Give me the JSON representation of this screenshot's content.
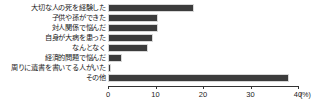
{
  "chart_data": {
    "type": "bar",
    "orientation": "horizontal",
    "title": "",
    "subtitle": "",
    "xlabel": "(%)",
    "ylabel": "",
    "xlim": [
      0,
      40
    ],
    "grid": false,
    "legend": null,
    "axis_unit": "(%)",
    "xticks": [
      0,
      10,
      20,
      30,
      40
    ],
    "xtick_labels": [
      "0",
      "10",
      "20",
      "30",
      "40"
    ],
    "categories": [
      "大切な人の死を経験した",
      "子供や孫ができた",
      "対人関係で悩んだ",
      "自身が大病を患った",
      "なんとなく",
      "経済的問題で悩んだ",
      "周りに遺書を書いてる人がいた",
      "その他"
    ],
    "values": [
      18.0,
      10.5,
      10.5,
      9.5,
      8.5,
      3.0,
      0.7,
      38.0
    ],
    "bar_color": "#3c3c3c",
    "background_color": "#ffffff",
    "axis_color": "#333333"
  }
}
